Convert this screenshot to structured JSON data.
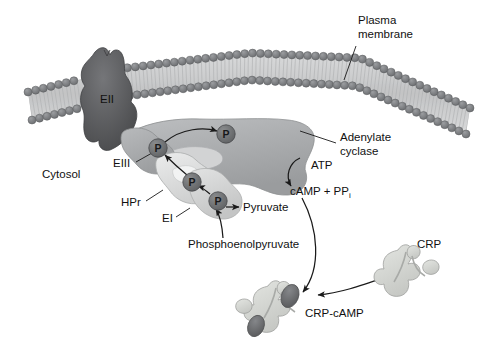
{
  "figure": {
    "background": "#ffffff"
  },
  "colors": {
    "membrane_head": "#7d7f83",
    "membrane_tail": "#c9cacb",
    "eii_protein": "#5d5e60",
    "eiii_protein": "#a9abad",
    "adenylate_cyclase": "#adafb1",
    "hpr_protein": "#dcdddd",
    "ei_protein": "#cfd0d0",
    "crp_protein": "#d5d7d4",
    "camp_site": "#6f7173",
    "phosphate_circle": "#6e7072",
    "text": "#111111",
    "line": "#1a1a1a"
  },
  "labels": {
    "plasma_membrane": {
      "line1": "Plasma",
      "line2": "membrane",
      "x": 358,
      "y": 20
    },
    "cytosol": {
      "text": "Cytosol",
      "x": 42,
      "y": 168
    },
    "eii": {
      "text": "EII",
      "x": 100,
      "y": 93
    },
    "eiii": {
      "text": "EIII",
      "x": 113,
      "y": 165
    },
    "hpr": {
      "text": "HPr",
      "x": 121,
      "y": 205
    },
    "ei": {
      "text": "EI",
      "x": 162,
      "y": 221
    },
    "adenylate_cyclase": {
      "line1": "Adenylate",
      "line2": "cyclase",
      "x": 340,
      "y": 138
    },
    "atp": {
      "text": "ATP",
      "x": 311,
      "y": 166
    },
    "camp_ppi": {
      "text": "cAMP + PP",
      "subscript": "i",
      "x": 290,
      "y": 192
    },
    "pyruvate": {
      "text": "Pyruvate",
      "x": 243,
      "y": 211
    },
    "phosphoenolpyruvate": {
      "text": "Phosphoenolpyruvate",
      "x": 188,
      "y": 245
    },
    "crp": {
      "text": "CRP",
      "x": 417,
      "y": 245
    },
    "crp_camp": {
      "text": "CRP-cAMP",
      "x": 305,
      "y": 315
    }
  },
  "phosphates": [
    {
      "name": "phosphate-on-eii-transfer",
      "label": "P",
      "x": 226,
      "y": 134
    },
    {
      "name": "phosphate-on-eiii",
      "label": "P",
      "x": 158,
      "y": 148
    },
    {
      "name": "phosphate-on-hpr",
      "label": "P",
      "x": 192,
      "y": 182
    },
    {
      "name": "phosphate-on-ei",
      "label": "P",
      "x": 218,
      "y": 201
    }
  ],
  "icons": {
    "membrane": "lipid-bilayer-icon",
    "eii": "transmembrane-protein-icon",
    "eiii": "protein-blob-icon",
    "hpr": "protein-blob-icon",
    "ei": "protein-blob-icon",
    "adenylate_cyclase": "enzyme-blob-icon",
    "crp": "crp-protein-icon",
    "crp_camp": "crp-camp-complex-icon",
    "phosphate": "phosphate-circle-icon"
  }
}
